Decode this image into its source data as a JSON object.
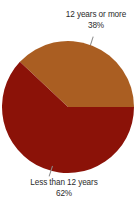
{
  "chart_data": {
    "type": "pie",
    "title": "",
    "xlabel": "",
    "ylabel": "",
    "legend_position": "none",
    "grid": false,
    "unit": "%",
    "categories": [
      "12 years or more",
      "Less than 12 years"
    ],
    "values": [
      38,
      62
    ],
    "slices": [
      {
        "label": "12 years or more",
        "value": 38,
        "value_label": "38%",
        "color": "#aa5e22",
        "label_position": "top",
        "start_angle_deg": 313.2,
        "end_angle_deg": 90.0
      },
      {
        "label": "Less than 12 years",
        "value": 62,
        "value_label": "62%",
        "color": "#8b1208",
        "label_position": "bottom",
        "start_angle_deg": 90.0,
        "end_angle_deg": 313.2
      }
    ]
  },
  "labels": {
    "top": {
      "text": "12 years or more",
      "value": "38%"
    },
    "bottom": {
      "text": "Less than 12 years",
      "value": "62%"
    }
  },
  "colors": {
    "slice_more": "#aa5e22",
    "slice_less": "#8b1208",
    "text": "#2b2b2b",
    "leader": "#8a8a8a",
    "background": "#ffffff"
  }
}
